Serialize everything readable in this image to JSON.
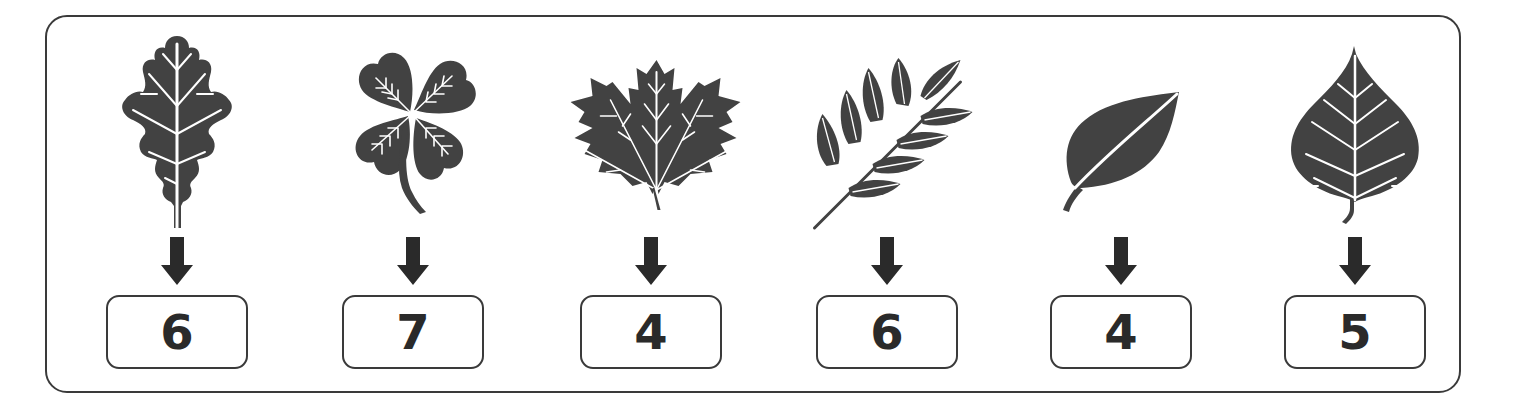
{
  "colors": {
    "leaf_fill": "#424242",
    "vein": "#ffffff",
    "arrow": "#2a2a2a",
    "border": "#3a3a3a",
    "text": "#2a2a2a",
    "background": "#ffffff"
  },
  "items": [
    {
      "leaf": "oak-leaf-icon",
      "value": "6"
    },
    {
      "leaf": "four-leaf-clover-icon",
      "value": "7"
    },
    {
      "leaf": "maple-leaf-icon",
      "value": "4"
    },
    {
      "leaf": "compound-leaf-icon",
      "value": "6"
    },
    {
      "leaf": "simple-leaf-icon",
      "value": "4"
    },
    {
      "leaf": "birch-leaf-icon",
      "value": "5"
    }
  ],
  "arrow_icon": "down-arrow-icon"
}
